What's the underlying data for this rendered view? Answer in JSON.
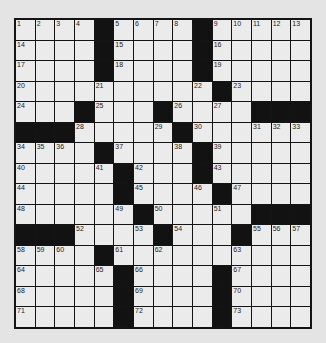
{
  "puzzle": {
    "type": "crossword",
    "rows": 15,
    "cols": 15,
    "colors": {
      "white": "#ebebeb",
      "black": "#121212",
      "background": "#e4e4e4",
      "border": "#141414"
    },
    "grid": [
      [
        "1",
        "2",
        "3",
        "4",
        "#",
        "5",
        "6",
        "7",
        "8",
        "#",
        "9",
        "10",
        "11",
        "12",
        "13"
      ],
      [
        "14",
        "",
        "",
        "",
        "#",
        "15",
        "",
        "",
        "",
        "#",
        "16",
        "",
        "",
        "",
        ""
      ],
      [
        "17",
        "",
        "",
        "",
        "#",
        "18",
        "",
        "",
        "",
        "#",
        "19",
        "",
        "",
        "",
        ""
      ],
      [
        "20",
        "",
        "",
        "",
        "21",
        "",
        "",
        "",
        "",
        "22",
        "#",
        "23",
        "",
        "",
        ""
      ],
      [
        "24",
        "",
        "",
        "#",
        "25",
        "",
        "",
        "#",
        "26",
        "",
        "27",
        "",
        "#",
        "#",
        "#"
      ],
      [
        "#",
        "#",
        "#",
        "28",
        "",
        "",
        "",
        "29",
        "#",
        "30",
        "",
        "",
        "31",
        "32",
        "33"
      ],
      [
        "34",
        "35",
        "36",
        "",
        "#",
        "37",
        "",
        "",
        "38",
        "#",
        "39",
        "",
        "",
        "",
        ""
      ],
      [
        "40",
        "",
        "",
        "",
        "41",
        "#",
        "42",
        "",
        "",
        "#",
        "43",
        "",
        "",
        "",
        ""
      ],
      [
        "44",
        "",
        "",
        "",
        "",
        "#",
        "45",
        "",
        "",
        "46",
        "#",
        "47",
        "",
        "",
        ""
      ],
      [
        "48",
        "",
        "",
        "",
        "",
        "49",
        "#",
        "50",
        "",
        "",
        "51",
        "",
        "#",
        "#",
        "#"
      ],
      [
        "#",
        "#",
        "#",
        "52",
        "",
        "",
        "53",
        "#",
        "54",
        "",
        "",
        "#",
        "55",
        "56",
        "57"
      ],
      [
        "58",
        "59",
        "60",
        "",
        "#",
        "61",
        "",
        "62",
        "",
        "",
        "",
        "63",
        "",
        "",
        ""
      ],
      [
        "64",
        "",
        "",
        "",
        "65",
        "#",
        "66",
        "",
        "",
        "",
        "#",
        "67",
        "",
        "",
        ""
      ],
      [
        "68",
        "",
        "",
        "",
        "",
        "#",
        "69",
        "",
        "",
        "",
        "#",
        "70",
        "",
        "",
        ""
      ],
      [
        "71",
        "",
        "",
        "",
        "",
        "#",
        "72",
        "",
        "",
        "",
        "#",
        "73",
        "",
        "",
        ""
      ]
    ]
  }
}
